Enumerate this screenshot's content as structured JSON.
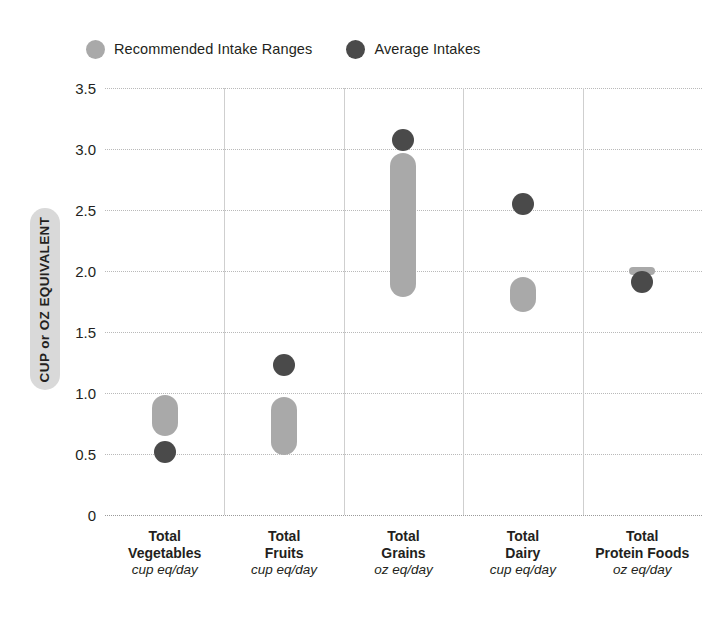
{
  "chart_data": {
    "type": "bar",
    "title": "",
    "subtitle": "",
    "xlabel": "",
    "ylabel": "CUP or OZ EQUIVALENT",
    "ylim": [
      0,
      3.5
    ],
    "ytick_labels": [
      "3.5",
      "3.0",
      "2.5",
      "2.0",
      "1.5",
      "1.0",
      "0.5",
      "0"
    ],
    "ytick_values": [
      3.5,
      3.0,
      2.5,
      2.0,
      1.5,
      1.0,
      0.5,
      0
    ],
    "grid": "horizontal-dotted",
    "legend_position": "top-left",
    "categories": [
      "Total Vegetables",
      "Total Fruits",
      "Total Grains",
      "Total Dairy",
      "Total Protein Foods"
    ],
    "category_units": [
      "cup eq/day",
      "cup eq/day",
      "oz eq/day",
      "cup eq/day",
      "oz eq/day"
    ],
    "series": [
      {
        "name": "Recommended Intake Ranges",
        "type": "range",
        "color": "#a9a9a9",
        "ranges": [
          {
            "low": 0.65,
            "high": 0.98
          },
          {
            "low": 0.49,
            "high": 0.97
          },
          {
            "low": 1.79,
            "high": 2.97
          },
          {
            "low": 1.66,
            "high": 1.95
          },
          {
            "low": 1.97,
            "high": 2.03
          }
        ]
      },
      {
        "name": "Average Intakes",
        "type": "point",
        "color": "#4a4a4a",
        "values": [
          0.52,
          1.23,
          3.07,
          2.55,
          1.91
        ]
      }
    ]
  },
  "legend": {
    "items": [
      {
        "label": "Recommended Intake Ranges",
        "color": "#a9a9a9"
      },
      {
        "label": "Average Intakes",
        "color": "#4a4a4a"
      }
    ]
  },
  "axis": {
    "y_title": "CUP or OZ EQUIVALENT"
  },
  "x_labels": [
    {
      "line1": "Total",
      "line2": "Vegetables",
      "unit": "cup eq/day"
    },
    {
      "line1": "Total",
      "line2": "Fruits",
      "unit": "cup eq/day"
    },
    {
      "line1": "Total",
      "line2": "Grains",
      "unit": "oz eq/day"
    },
    {
      "line1": "Total",
      "line2": "Dairy",
      "unit": "cup eq/day"
    },
    {
      "line1": "Total",
      "line2": "Protein Foods",
      "unit": "oz eq/day"
    }
  ]
}
